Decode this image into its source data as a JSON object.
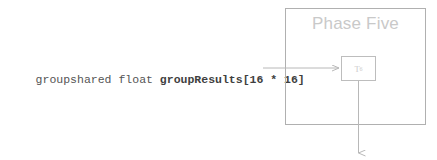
{
  "diagram": {
    "type": "flow-diagram",
    "background_color": "#ffffff",
    "declaration": {
      "full_text": "groupshared float groupResults[16 * 16]",
      "plain_part": "groupshared float ",
      "bold_part": "groupResults[16 * 16]",
      "color": "#555555"
    },
    "phase_box": {
      "title": "Phase Five",
      "title_color": "#c9c9c9",
      "border_color": "#b0b0b0"
    },
    "thread_box": {
      "label_base": "T",
      "label_subscript": "6",
      "label_color": "#cccccc",
      "border_color": "#bdbdbd"
    },
    "connectors": {
      "arrow_color": "#b8b8b8",
      "incoming_arrow_name": "declaration-to-thread-arrow",
      "outgoing_arrow_name": "thread-output-arrow"
    }
  }
}
